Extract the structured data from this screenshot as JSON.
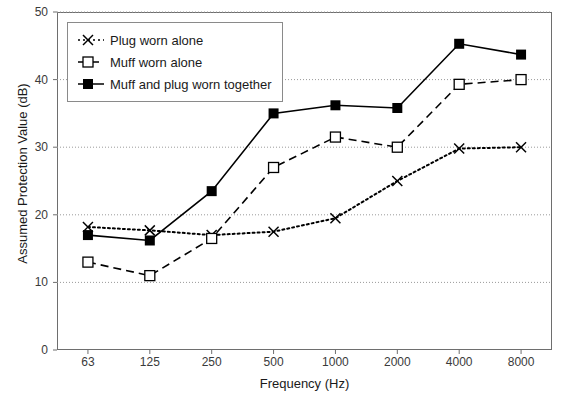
{
  "chart_data": {
    "type": "line",
    "title": "",
    "xlabel": "Frequency (Hz)",
    "ylabel": "Assumed Protection Value (dB)",
    "categories": [
      "63",
      "125",
      "250",
      "500",
      "1000",
      "2000",
      "4000",
      "8000"
    ],
    "x_tick_labels": [
      "63",
      "125",
      "250",
      "500",
      "1000",
      "2000",
      "4000",
      "8000"
    ],
    "y_tick_labels": [
      "0",
      "10",
      "20",
      "30",
      "40",
      "50"
    ],
    "y_ticks": [
      0,
      10,
      20,
      30,
      40,
      50
    ],
    "ylim": [
      0,
      50
    ],
    "grid": "horizontal-dotted",
    "legend_position": "top-left",
    "series": [
      {
        "name": "Plug worn alone",
        "marker": "x-cross",
        "line_style": "dotted",
        "color": "#000000",
        "values": [
          18.2,
          17.7,
          17.0,
          17.5,
          19.5,
          25.0,
          29.8,
          30.0
        ]
      },
      {
        "name": "Muff worn alone",
        "marker": "open-square",
        "line_style": "dashed",
        "color": "#000000",
        "values": [
          13.0,
          11.0,
          16.5,
          27.0,
          31.5,
          30.0,
          39.3,
          40.0
        ]
      },
      {
        "name": "Muff and plug worn together",
        "marker": "filled-square",
        "line_style": "solid",
        "color": "#000000",
        "values": [
          17.0,
          16.2,
          23.5,
          35.0,
          36.2,
          35.8,
          45.3,
          43.7
        ]
      }
    ]
  },
  "legend": {
    "items": [
      {
        "label": "Plug worn alone"
      },
      {
        "label": "Muff worn alone"
      },
      {
        "label": "Muff and plug worn together"
      }
    ]
  },
  "colors": {
    "axis": "#6e6e6e",
    "grid": "#9a9a9a",
    "text": "#1a1a1a",
    "series": "#000000"
  }
}
